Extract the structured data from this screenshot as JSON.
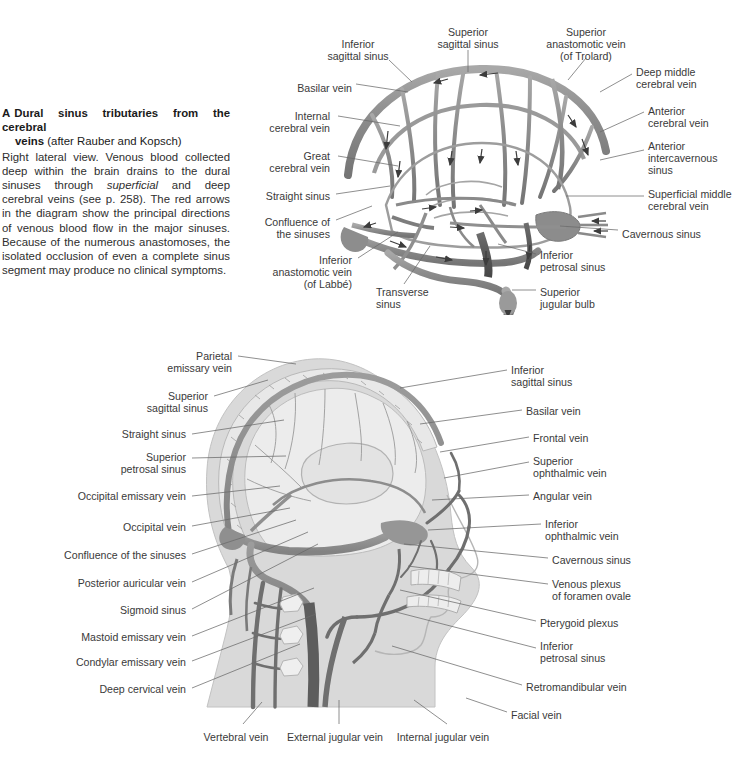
{
  "figure_a": {
    "caption": {
      "letter": "A",
      "title_line1": "Dural sinus tributaries from the cerebral",
      "title_line2": "veins",
      "attribution": "(after Rauber and Kopsch)",
      "body_1": "Right lateral view. Venous blood collected deep within the brain drains to the dural sinuses through ",
      "body_italic": "superficial",
      "body_2": " and deep cerebral veins (see p. 258). The red arrows in the diagram show the principal directions of venous blood flow in the major sinuses. Because of the numerous anastomoses, the isolated occlusion of even a complete sinus segment may produce no clinical symptoms."
    },
    "labels": [
      {
        "id": "inferior-sagittal-sinus",
        "text": "Inferior\nsagittal sinus",
        "x": 358,
        "y": 38,
        "align": "center"
      },
      {
        "id": "superior-sagittal-sinus",
        "text": "Superior\nsagittal sinus",
        "x": 468,
        "y": 26,
        "align": "center"
      },
      {
        "id": "superior-anastomotic-vein",
        "text": "Superior\nanastomotic vein\n(of Trolard)",
        "x": 586,
        "y": 26,
        "align": "center"
      },
      {
        "id": "deep-middle-cerebral-vein",
        "text": "Deep middle\ncerebral vein",
        "x": 636,
        "y": 66,
        "align": "left"
      },
      {
        "id": "anterior-cerebral-vein",
        "text": "Anterior\ncerebral vein",
        "x": 648,
        "y": 105,
        "align": "left"
      },
      {
        "id": "anterior-intercavernous-sinus",
        "text": "Anterior\nintercavernous\nsinus",
        "x": 648,
        "y": 140,
        "align": "left"
      },
      {
        "id": "superficial-middle-cerebral-vein",
        "text": "Superficial middle\ncerebral vein",
        "x": 648,
        "y": 188,
        "align": "left"
      },
      {
        "id": "cavernous-sinus",
        "text": "Cavernous sinus",
        "x": 622,
        "y": 228,
        "align": "left"
      },
      {
        "id": "basilar-vein",
        "text": "Basilar vein",
        "x": 352,
        "y": 82,
        "align": "right"
      },
      {
        "id": "internal-cerebral-vein",
        "text": "Internal\ncerebral vein",
        "x": 330,
        "y": 110,
        "align": "right"
      },
      {
        "id": "great-cerebral-vein",
        "text": "Great\ncerebral vein",
        "x": 330,
        "y": 150,
        "align": "right"
      },
      {
        "id": "straight-sinus",
        "text": "Straight sinus",
        "x": 330,
        "y": 190,
        "align": "right"
      },
      {
        "id": "confluence-of-the-sinuses",
        "text": "Confluence of\nthe sinuses",
        "x": 330,
        "y": 216,
        "align": "right"
      },
      {
        "id": "inferior-anastomotic-vein",
        "text": "Inferior\nanastomotic vein\n(of Labbé)",
        "x": 352,
        "y": 254,
        "align": "right"
      },
      {
        "id": "transverse-sinus",
        "text": "Transverse\nsinus",
        "x": 376,
        "y": 286,
        "align": "left"
      },
      {
        "id": "inferior-petrosal-sinus",
        "text": "Inferior\npetrosal sinus",
        "x": 540,
        "y": 249,
        "align": "left"
      },
      {
        "id": "superior-jugular-bulb",
        "text": "Superior\njugular bulb",
        "x": 540,
        "y": 286,
        "align": "left"
      }
    ]
  },
  "figure_b": {
    "labels_left": [
      {
        "id": "parietal-emissary-vein",
        "text": "Parietal\nemissary vein",
        "x": 232,
        "y": 350
      },
      {
        "id": "superior-sagittal-sinus-b",
        "text": "Superior\nsagittal sinus",
        "x": 208,
        "y": 390
      },
      {
        "id": "straight-sinus-b",
        "text": "Straight sinus",
        "x": 186,
        "y": 428
      },
      {
        "id": "superior-petrosal-sinus",
        "text": "Superior\npetrosal sinus",
        "x": 186,
        "y": 451
      },
      {
        "id": "occipital-emissary-vein",
        "text": "Occipital emissary vein",
        "x": 186,
        "y": 490
      },
      {
        "id": "occipital-vein",
        "text": "Occipital vein",
        "x": 186,
        "y": 521
      },
      {
        "id": "confluence-of-the-sinuses-b",
        "text": "Confluence of the sinuses",
        "x": 186,
        "y": 549
      },
      {
        "id": "posterior-auricular-vein",
        "text": "Posterior auricular vein",
        "x": 186,
        "y": 577
      },
      {
        "id": "sigmoid-sinus",
        "text": "Sigmoid sinus",
        "x": 186,
        "y": 604
      },
      {
        "id": "mastoid-emissary-vein",
        "text": "Mastoid emissary vein",
        "x": 186,
        "y": 631
      },
      {
        "id": "condylar-emissary-vein",
        "text": "Condylar emissary vein",
        "x": 186,
        "y": 656
      },
      {
        "id": "deep-cervical-vein",
        "text": "Deep cervical vein",
        "x": 186,
        "y": 683
      }
    ],
    "labels_right": [
      {
        "id": "inferior-sagittal-sinus-b",
        "text": "Inferior\nsagittal sinus",
        "x": 511,
        "y": 364
      },
      {
        "id": "basilar-vein-b",
        "text": "Basilar vein",
        "x": 526,
        "y": 405
      },
      {
        "id": "frontal-vein",
        "text": "Frontal vein",
        "x": 533,
        "y": 432
      },
      {
        "id": "superior-ophthalmic-vein",
        "text": "Superior\nophthalmic vein",
        "x": 533,
        "y": 455
      },
      {
        "id": "angular-vein",
        "text": "Angular vein",
        "x": 533,
        "y": 490
      },
      {
        "id": "inferior-ophthalmic-vein",
        "text": "Inferior\nophthalmic vein",
        "x": 545,
        "y": 518
      },
      {
        "id": "cavernous-sinus-b",
        "text": "Cavernous sinus",
        "x": 552,
        "y": 554
      },
      {
        "id": "venous-plexus-foramen-ovale",
        "text": "Venous plexus\nof foramen ovale",
        "x": 552,
        "y": 578
      },
      {
        "id": "pterygoid-plexus",
        "text": "Pterygoid plexus",
        "x": 540,
        "y": 617
      },
      {
        "id": "inferior-petrosal-sinus-b",
        "text": "Inferior\npetrosal sinus",
        "x": 540,
        "y": 640
      },
      {
        "id": "retromandibular-vein",
        "text": "Retromandibular vein",
        "x": 526,
        "y": 681
      },
      {
        "id": "facial-vein",
        "text": "Facial vein",
        "x": 511,
        "y": 709
      }
    ],
    "labels_bottom": [
      {
        "id": "vertebral-vein",
        "text": "Vertebral vein",
        "x": 236,
        "y": 731
      },
      {
        "id": "external-jugular-vein",
        "text": "External jugular vein",
        "x": 335,
        "y": 731
      },
      {
        "id": "internal-jugular-vein",
        "text": "Internal jugular vein",
        "x": 443,
        "y": 731
      }
    ]
  },
  "colors": {
    "ink": "#3a3a3a",
    "heading": "#1a1a1a",
    "leader": "#6a6a6a",
    "vessel_mid": "#8f8f8f",
    "vessel_dark": "#5b5b5b",
    "vessel_darkest": "#4a4a4a",
    "brain_fill": "#e4e4e4",
    "skull_fill": "#cfcfcf",
    "soft_tissue": "#d8d8d8",
    "background": "#ffffff"
  }
}
